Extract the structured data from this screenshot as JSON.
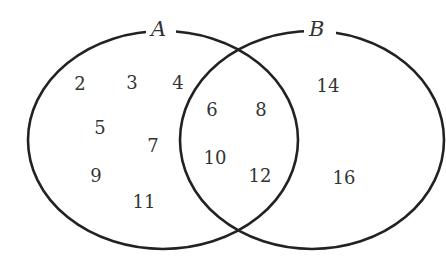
{
  "diagram": {
    "type": "venn",
    "stroke_color": "#222222",
    "text_color": "#333333",
    "background": "#ffffff",
    "sets": [
      {
        "label": "A",
        "only_elements": [
          "2",
          "3",
          "4",
          "5",
          "7",
          "9",
          "11"
        ]
      },
      {
        "label": "B",
        "only_elements": [
          "14",
          "16"
        ]
      }
    ],
    "intersection_elements": [
      "6",
      "8",
      "10",
      "12"
    ],
    "labels": {
      "set_a": "A",
      "set_b": "B"
    },
    "elements": {
      "e2": "2",
      "e3": "3",
      "e4": "4",
      "e5": "5",
      "e7": "7",
      "e9": "9",
      "e11": "11",
      "e6": "6",
      "e8": "8",
      "e10": "10",
      "e12": "12",
      "e14": "14",
      "e16": "16"
    }
  }
}
